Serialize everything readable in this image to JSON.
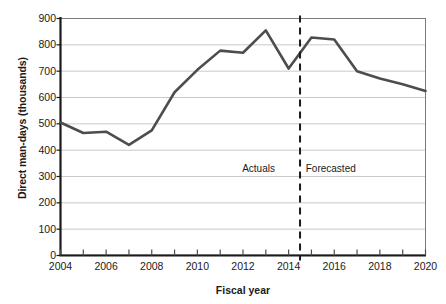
{
  "chart_data": {
    "type": "line",
    "title": "",
    "xlabel": "Fiscal year",
    "ylabel": "Direct man-days (thousands)",
    "xlim": [
      2004,
      2020
    ],
    "ylim": [
      0,
      900
    ],
    "ytick_step": 100,
    "xtick_step": 1,
    "xtick_label_step": 2,
    "grid": "horizontal",
    "legend": "none",
    "x": [
      2004,
      2005,
      2006,
      2007,
      2008,
      2009,
      2010,
      2011,
      2012,
      2013,
      2014,
      2015,
      2016,
      2017,
      2018,
      2019,
      2020
    ],
    "series": [
      {
        "name": "Direct man-days",
        "color": "#4d4d4d",
        "values": [
          505,
          465,
          470,
          420,
          475,
          620,
          705,
          778,
          770,
          855,
          710,
          828,
          820,
          700,
          672,
          650,
          625
        ]
      }
    ],
    "ytick_labels": [
      "900",
      "800",
      "700",
      "600",
      "500",
      "400",
      "300",
      "200",
      "100",
      "0"
    ],
    "ytick_values": [
      900,
      800,
      700,
      600,
      500,
      400,
      300,
      200,
      100,
      0
    ],
    "xtick_labels": [
      "2004",
      "2006",
      "2008",
      "2010",
      "2012",
      "2014",
      "2016",
      "2018",
      "2020"
    ],
    "xtick_values": [
      2004,
      2006,
      2008,
      2010,
      2012,
      2014,
      2016,
      2018,
      2020
    ],
    "annotations": [
      {
        "text": "Actuals",
        "x": 2013.4,
        "y": 330,
        "align": "right"
      },
      {
        "text": "Forecasted",
        "x": 2014.75,
        "y": 330,
        "align": "left"
      }
    ],
    "divider": {
      "x": 2014.5,
      "style": "dashed",
      "color": "#1a1a1a"
    }
  }
}
